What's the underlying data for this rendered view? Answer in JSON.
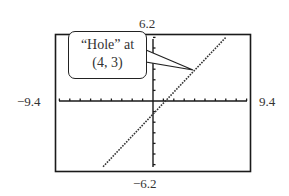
{
  "chart_data": {
    "type": "line",
    "title": "",
    "xlabel": "",
    "ylabel": "",
    "xlim": [
      -9.4,
      9.4
    ],
    "ylim": [
      -6.2,
      6.2
    ],
    "x_tick_spacing": 1,
    "y_tick_spacing": 1,
    "grid": false,
    "window_labels": {
      "xmin": "−9.4",
      "xmax": "9.4",
      "ymin": "−6.2",
      "ymax": "6.2"
    },
    "series": [
      {
        "name": "y = x − 1",
        "style": "dotted",
        "x": [
          -4.8,
          7.0
        ],
        "y": [
          -6.2,
          6.0
        ]
      }
    ],
    "annotations": [
      {
        "text_line1": "“Hole” at",
        "text_line2": "(4, 3)",
        "point": [
          4,
          3
        ]
      }
    ]
  },
  "colors": {
    "frame": "#1a1a1a",
    "axis": "#1a1a1a",
    "curve": "#333333",
    "background": "#ffffff"
  }
}
